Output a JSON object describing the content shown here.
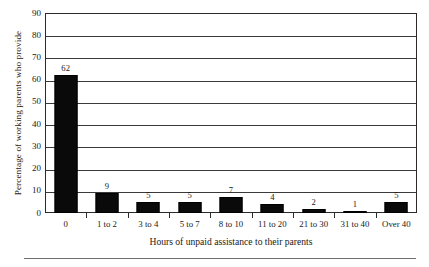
{
  "chart_data": {
    "type": "bar",
    "title": "",
    "subtitle": "",
    "xlabel": "Hours of unpaid assistance to their parents",
    "ylabel": "Percentage of working parents who provide",
    "categories": [
      "0",
      "1 to 2",
      "3 to 4",
      "5 to 7",
      "8 to 10",
      "11 to 20",
      "21 to 30",
      "31 to 40",
      "Over 40"
    ],
    "values": [
      62,
      9,
      5,
      5,
      7,
      4,
      2,
      1,
      5
    ],
    "data_labels": [
      "62",
      "9",
      "5",
      "5",
      "7",
      "4",
      "2",
      "1",
      "5"
    ],
    "ylim": [
      0,
      90
    ],
    "ytick_values": [
      0,
      10,
      20,
      30,
      40,
      50,
      60,
      70,
      80,
      90
    ],
    "ytick_labels": [
      "0",
      "10",
      "20",
      "30",
      "40",
      "50",
      "60",
      "70",
      "80",
      "90"
    ],
    "grid": true,
    "grid_axis": "y",
    "legend": false,
    "legend_position": "none",
    "bar_color": "#0a0a0a",
    "axis_color": "#2b2b2b",
    "grid_color": "#3a3a3a",
    "background": "#ffffff"
  }
}
